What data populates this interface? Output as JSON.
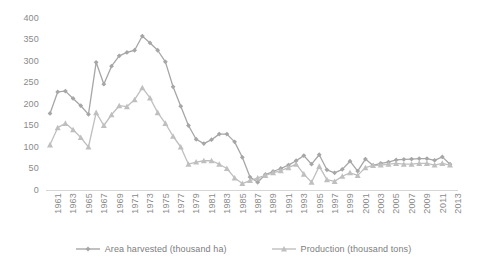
{
  "chart_data": {
    "type": "line",
    "title": "",
    "xlabel": "",
    "ylabel": "",
    "ylim": [
      0,
      400
    ],
    "ytick_step": 50,
    "grid": false,
    "legend_position": "bottom",
    "x": [
      1961,
      1962,
      1963,
      1964,
      1965,
      1966,
      1967,
      1968,
      1969,
      1970,
      1971,
      1972,
      1973,
      1974,
      1975,
      1976,
      1977,
      1978,
      1979,
      1980,
      1981,
      1982,
      1983,
      1984,
      1985,
      1986,
      1987,
      1988,
      1989,
      1990,
      1991,
      1992,
      1993,
      1994,
      1995,
      1996,
      1997,
      1998,
      1999,
      2000,
      2001,
      2002,
      2003,
      2004,
      2005,
      2006,
      2007,
      2008,
      2009,
      2010,
      2011,
      2012,
      2013
    ],
    "xtick_labels": [
      "1961",
      "1963",
      "1965",
      "1967",
      "1969",
      "1971",
      "1973",
      "1975",
      "1977",
      "1979",
      "1981",
      "1983",
      "1985",
      "1987",
      "1989",
      "1991",
      "1993",
      "1995",
      "1997",
      "1999",
      "2001",
      "2003",
      "2005",
      "2007",
      "2009",
      "2011",
      "2013"
    ],
    "ytick_labels": [
      "0",
      "50",
      "100",
      "150",
      "200",
      "250",
      "300",
      "350",
      "400"
    ],
    "series": [
      {
        "name": "Area harvested (thousand ha)",
        "marker": "diamond",
        "color": "#a6a6a6",
        "values": [
          178,
          228,
          230,
          213,
          196,
          176,
          297,
          246,
          288,
          312,
          320,
          325,
          358,
          342,
          325,
          298,
          240,
          195,
          150,
          118,
          108,
          117,
          130,
          130,
          112,
          76,
          30,
          18,
          36,
          43,
          50,
          58,
          68,
          80,
          60,
          82,
          47,
          40,
          48,
          67,
          44,
          72,
          57,
          62,
          65,
          70,
          71,
          72,
          73,
          73,
          69,
          77,
          60
        ]
      },
      {
        "name": "Production (thousand tons)",
        "marker": "triangle",
        "color": "#bfbfbf",
        "values": [
          105,
          145,
          155,
          140,
          122,
          100,
          180,
          150,
          175,
          196,
          194,
          210,
          238,
          214,
          180,
          155,
          125,
          100,
          60,
          65,
          68,
          68,
          60,
          50,
          28,
          15,
          22,
          28,
          34,
          40,
          45,
          52,
          60,
          37,
          18,
          55,
          24,
          20,
          32,
          40,
          34,
          52,
          57,
          58,
          60,
          62,
          60,
          60,
          62,
          62,
          58,
          62,
          58
        ]
      }
    ],
    "series_late": {
      "note": "values 1995-2013 read from overlapping cluster near 40-145",
      "area_harvested_late": [
        72,
        68,
        70,
        71,
        72,
        72,
        73,
        73,
        70,
        112,
        78,
        90,
        95,
        85,
        118,
        140,
        112,
        80,
        78
      ],
      "production_late": [
        55,
        52,
        58,
        60,
        62,
        60,
        62,
        63,
        57,
        62,
        60,
        78,
        85,
        70,
        90,
        120,
        95,
        65,
        70
      ]
    }
  },
  "legend": {
    "items": [
      {
        "label": "Area harvested (thousand ha)",
        "marker": "diamond-marker",
        "color": "#a6a6a6"
      },
      {
        "label": "Production (thousand tons)",
        "marker": "triangle-marker",
        "color": "#bfbfbf"
      }
    ]
  }
}
